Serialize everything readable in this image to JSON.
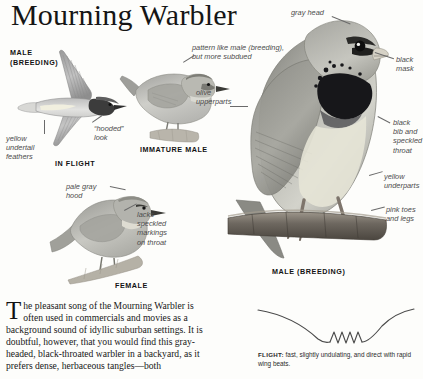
{
  "page": {
    "title": "Mourning Warbler",
    "background_color": "#fdfdfb",
    "ink_color": "#1a1a1a",
    "label_color": "#4c4c4c"
  },
  "figures": {
    "in_flight": {
      "caption_line1": "MALE",
      "caption_line2": "(BREEDING)",
      "bottom_caption": "IN FLIGHT",
      "labels": {
        "undertail": "yellow\nundertail\nfeathers",
        "hooded": "“hooded”\nlook"
      }
    },
    "immature_male": {
      "caption": "IMMATURE MALE",
      "labels": {
        "pattern": "pattern like male (breeding),\nbut more subdued",
        "upperparts": "olive\nupperparts"
      }
    },
    "female": {
      "caption": "FEMALE",
      "labels": {
        "hood": "pale gray\nhood",
        "throat": "lacks\nspeckled\nmarkings\non throat"
      }
    },
    "male_breeding": {
      "caption": "MALE (BREEDING)",
      "labels": {
        "gray_head": "gray head",
        "black_mask": "black\nmask",
        "bib": "black\nbib and\nspeckled\nthroat",
        "underparts": "yellow\nunderparts",
        "legs": "pink toes\nand legs"
      }
    }
  },
  "article": {
    "dropcap": "T",
    "first_line_rest": "he pleasant song of the Mourning Warbler is",
    "body": "often used in commercials and movies as a background sound of idyllic suburban settings. It is doubtful, however, that you would find this gray-headed, black-throated warbler in a backyard, as it prefers dense, herbaceous tangles—both"
  },
  "flight": {
    "label": "FLIGHT:",
    "description": "fast, slightly undulating, and direct with rapid wing beats."
  }
}
